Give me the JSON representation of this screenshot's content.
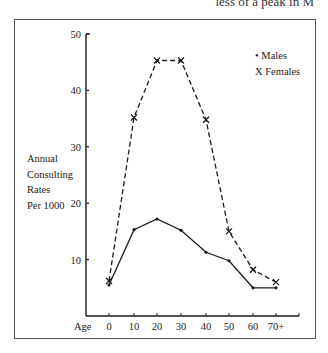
{
  "page": {
    "header_fragment": "less of a peak in M"
  },
  "chart_data": {
    "type": "line",
    "title": "",
    "xlabel": "Age",
    "ylabel": "Annual Consulting Rates Per 1000",
    "ylabel_lines": [
      "Annual",
      "Consulting",
      "Rates",
      "Per 1000"
    ],
    "categories": [
      "0",
      "10",
      "20",
      "30",
      "40",
      "50",
      "60",
      "70+"
    ],
    "y_ticks": [
      10,
      20,
      30,
      40,
      50
    ],
    "ylim": [
      0,
      50
    ],
    "grid": false,
    "legend_position": "top-right",
    "legend": [
      "• Males",
      "X Females"
    ],
    "series": [
      {
        "name": "Males",
        "marker": "dot",
        "line": "solid",
        "values": [
          5.5,
          15.3,
          17.2,
          15.2,
          11.3,
          9.8,
          5.0,
          5.0
        ]
      },
      {
        "name": "Females",
        "marker": "x",
        "line": "dashed",
        "values": [
          6.2,
          35.2,
          45.3,
          45.3,
          34.8,
          15.0,
          8.2,
          6.0
        ]
      }
    ]
  }
}
